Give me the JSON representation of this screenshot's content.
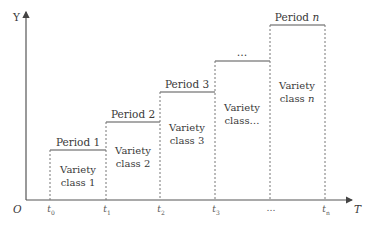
{
  "axes": {
    "y_label": "Y",
    "x_label": "T",
    "origin_label": "O"
  },
  "ticks": [
    {
      "base": "t",
      "sub": "0",
      "x": 50
    },
    {
      "base": "t",
      "sub": "1",
      "x": 106
    },
    {
      "base": "t",
      "sub": "2",
      "x": 160
    },
    {
      "base": "t",
      "sub": "3",
      "x": 215
    },
    {
      "base": "…",
      "sub": "",
      "x": 270
    },
    {
      "base": "t",
      "sub": "n",
      "x": 325
    }
  ],
  "periods": [
    {
      "title": "Period 1",
      "class_line1": "Variety",
      "class_line2": "class 1"
    },
    {
      "title": "Period 2",
      "class_line1": "Variety",
      "class_line2": "class 2"
    },
    {
      "title": "Period 3",
      "class_line1": "Variety",
      "class_line2": "class 3"
    },
    {
      "title": "…",
      "class_line1": "Variety",
      "class_line2": "class…"
    },
    {
      "title_prefix": "Period ",
      "title_var": "n",
      "class_line1": "Variety",
      "class_line2_prefix": "class ",
      "class_line2_var": "n"
    }
  ],
  "colors": {
    "line": "#555555",
    "dash": "#777777",
    "text": "#3a3a3a"
  }
}
